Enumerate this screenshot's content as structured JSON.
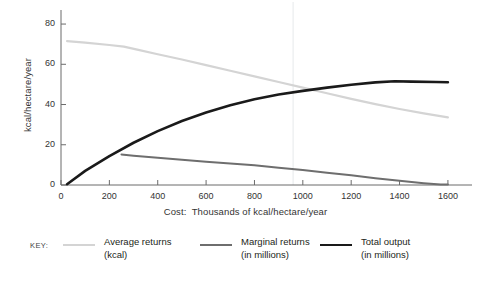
{
  "chart_data": {
    "type": "line",
    "title": "",
    "subtitle": "",
    "xlabel": "Cost:  Thousands of kcal/hectare/year",
    "ylabel": "kcal/hectare/year",
    "xlim": [
      0,
      1650
    ],
    "ylim": [
      0,
      85
    ],
    "xticks": [
      0,
      200,
      400,
      600,
      800,
      1000,
      1200,
      1400,
      1600
    ],
    "yticks": [
      0,
      20,
      40,
      60,
      80
    ],
    "grid": false,
    "legend_position": "bottom",
    "legend_key_label": "KEY:",
    "annotations": [
      {
        "type": "vline",
        "x": 960,
        "note": "faint vertical reference line at crossover of average returns and total output"
      }
    ],
    "series": [
      {
        "name": "Average returns",
        "sublabel": "(kcal)",
        "color": "#d4d4d4",
        "width": 2.2,
        "points": [
          [
            25,
            71.5
          ],
          [
            100,
            70.8
          ],
          [
            200,
            69.6
          ],
          [
            260,
            68.8
          ],
          [
            320,
            67.2
          ],
          [
            400,
            65.0
          ],
          [
            500,
            62.4
          ],
          [
            600,
            59.6
          ],
          [
            700,
            56.8
          ],
          [
            800,
            54.0
          ],
          [
            900,
            51.2
          ],
          [
            1000,
            48.4
          ],
          [
            1100,
            45.6
          ],
          [
            1200,
            42.8
          ],
          [
            1300,
            40.2
          ],
          [
            1400,
            37.8
          ],
          [
            1500,
            35.6
          ],
          [
            1600,
            33.6
          ]
        ]
      },
      {
        "name": "Marginal returns",
        "sublabel": "(in millions)",
        "color": "#6e6e6e",
        "width": 2.0,
        "points": [
          [
            250,
            15.2
          ],
          [
            300,
            14.6
          ],
          [
            400,
            13.6
          ],
          [
            500,
            12.6
          ],
          [
            600,
            11.6
          ],
          [
            700,
            10.7
          ],
          [
            800,
            9.8
          ],
          [
            900,
            8.6
          ],
          [
            1000,
            7.4
          ],
          [
            1100,
            6.1
          ],
          [
            1200,
            4.8
          ],
          [
            1300,
            3.4
          ],
          [
            1400,
            2.1
          ],
          [
            1500,
            0.9
          ],
          [
            1570,
            0.2
          ],
          [
            1600,
            0.2
          ]
        ]
      },
      {
        "name": "Total output",
        "sublabel": "(in millions)",
        "color": "#1a1a1a",
        "width": 2.6,
        "points": [
          [
            25,
            0.4
          ],
          [
            100,
            7.0
          ],
          [
            200,
            14.4
          ],
          [
            300,
            21.0
          ],
          [
            400,
            26.8
          ],
          [
            500,
            31.8
          ],
          [
            600,
            36.0
          ],
          [
            700,
            39.6
          ],
          [
            800,
            42.6
          ],
          [
            900,
            45.0
          ],
          [
            1000,
            46.8
          ],
          [
            1100,
            48.4
          ],
          [
            1200,
            49.8
          ],
          [
            1300,
            51.0
          ],
          [
            1380,
            51.6
          ],
          [
            1450,
            51.4
          ],
          [
            1550,
            51.2
          ],
          [
            1600,
            51.1
          ]
        ]
      }
    ]
  }
}
